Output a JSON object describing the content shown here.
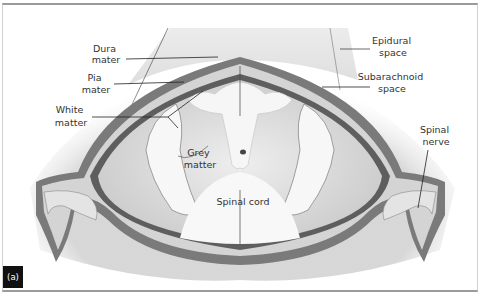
{
  "figure": {
    "panel_label": "(a)",
    "labels": {
      "dura_mater": [
        "Dura",
        "mater"
      ],
      "pia_mater": [
        "Pia",
        "mater"
      ],
      "white_matter": [
        "White",
        "matter"
      ],
      "grey_matter": [
        "Grey",
        "matter"
      ],
      "spinal_cord": "Spinal cord",
      "epidural_space": [
        "Epidural",
        "space"
      ],
      "subarachnoid_space": [
        "Subarachnoid",
        "space"
      ],
      "spinal_nerve": [
        "Spinal",
        "nerve"
      ]
    },
    "colors": {
      "meninges": "#6e6e6e",
      "grey_matter": "#d9d9d9",
      "white_matter": "#f4f4f4",
      "epidural": "#e6e6e6",
      "leader": "#222222"
    }
  }
}
